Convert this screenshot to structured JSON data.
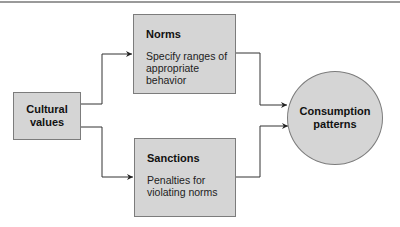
{
  "diagram": {
    "nodes": {
      "cultural_values": {
        "title": "Cultural values",
        "shape": "rectangle"
      },
      "norms": {
        "title": "Norms",
        "description": "Specify ranges of appropriate behavior",
        "shape": "rectangle"
      },
      "sanctions": {
        "title": "Sanctions",
        "description": "Penalties for violating norms",
        "shape": "rectangle"
      },
      "consumption_patterns": {
        "title": "Consumption patterns",
        "shape": "circle"
      }
    },
    "edges": [
      {
        "from": "cultural_values",
        "to": "norms"
      },
      {
        "from": "cultural_values",
        "to": "sanctions"
      },
      {
        "from": "norms",
        "to": "consumption_patterns"
      },
      {
        "from": "sanctions",
        "to": "consumption_patterns"
      }
    ],
    "colors": {
      "node_fill": "#d5d5d5",
      "node_border": "#7c7c7c",
      "connector": "#333333",
      "text": "#111111"
    }
  }
}
